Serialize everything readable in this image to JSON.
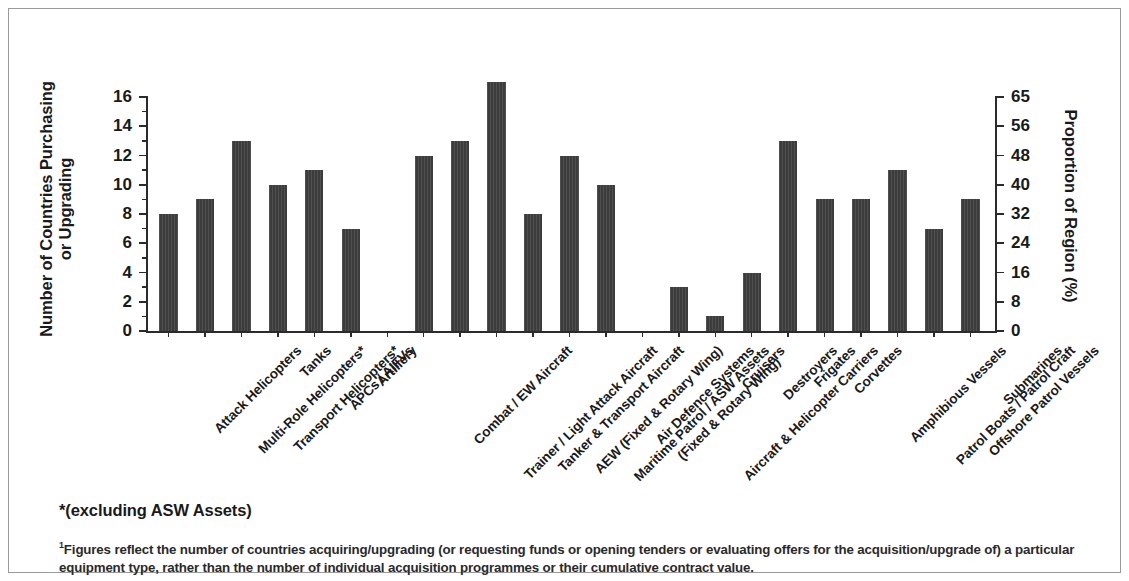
{
  "axes": {
    "left_title": "Number of Countries Purchasing or Upgrading",
    "right_title": "Proportion of Region (%)",
    "left_ticks": [
      "0",
      "2",
      "4",
      "6",
      "8",
      "10",
      "12",
      "14",
      "16"
    ],
    "right_ticks": [
      "0",
      "8",
      "16",
      "24",
      "32",
      "40",
      "48",
      "56",
      "65"
    ]
  },
  "notes": {
    "asterisk": "*(excluding ASW Assets)",
    "footnote_marker": "1",
    "footnote": "Figures reflect the number of countries acquiring/upgrading (or requesting funds or opening tenders or evaluating offers for the acquisition/upgrade of) a particular equipment type, rather than the number of individual acquisition programmes or their cumulative contract value."
  },
  "colors": {
    "bar": "#3c3c3c",
    "axis": "#2b2b2b",
    "border": "#9a9a9a",
    "background": "#ffffff"
  },
  "chart_data": {
    "type": "bar",
    "title": "",
    "xlabel": "",
    "ylabel": "Number of Countries Purchasing or Upgrading",
    "y2label": "Proportion of Region (%)",
    "ylim": [
      0,
      16
    ],
    "y2lim": [
      0,
      65
    ],
    "yticks": [
      0,
      2,
      4,
      6,
      8,
      10,
      12,
      14,
      16
    ],
    "y2ticks": [
      0,
      8,
      16,
      24,
      32,
      40,
      48,
      56,
      65
    ],
    "grid": false,
    "legend": "none",
    "groups": [
      {
        "name": "land-and-rotary",
        "categories": [
          "Attack Helicopters",
          "Multi-Role Helicopters*",
          "Transport Helicopters*",
          "Tanks",
          "APCs / AIFVs",
          "Artillery"
        ],
        "values": [
          8,
          9,
          13,
          10,
          11,
          7
        ]
      },
      {
        "name": "air",
        "categories": [
          "Combat / EW Aircraft",
          "Trainer / Light Attack Aircraft",
          "Tanker & Transport Aircraft",
          "AEW (Fixed & Rotary Wing)",
          "Maritime Patrol / ASW Assets (Fixed & Rotary Wing)",
          "Air Defence Systems"
        ],
        "values": [
          12,
          13,
          17,
          8,
          12,
          10
        ]
      },
      {
        "name": "naval",
        "categories": [
          "Aircraft & Helicopter Carriers",
          "Cruisers",
          "Destroyers",
          "Frigates",
          "Corvettes",
          "Amphibious Vessels",
          "Patrol Boats / Patrol Craft",
          "Offshore Patrol Vessels",
          "Submarines"
        ],
        "values": [
          3,
          1,
          4,
          13,
          9,
          9,
          11,
          7,
          9
        ]
      }
    ],
    "categories": [
      "Attack Helicopters",
      "Multi-Role Helicopters*",
      "Transport Helicopters*",
      "Tanks",
      "APCs / AIFVs",
      "Artillery",
      "Combat / EW Aircraft",
      "Trainer / Light Attack Aircraft",
      "Tanker & Transport Aircraft",
      "AEW (Fixed & Rotary Wing)",
      "Maritime Patrol / ASW Assets (Fixed & Rotary Wing)",
      "Air Defence Systems",
      "Aircraft & Helicopter Carriers",
      "Cruisers",
      "Destroyers",
      "Frigates",
      "Corvettes",
      "Amphibious Vessels",
      "Patrol Boats / Patrol Craft",
      "Offshore Patrol Vessels",
      "Submarines"
    ],
    "values": [
      8,
      9,
      13,
      10,
      11,
      7,
      12,
      13,
      17,
      8,
      12,
      10,
      3,
      1,
      4,
      13,
      9,
      9,
      11,
      7,
      9
    ],
    "category_labels_wrapped": [
      [
        "Attack Helicopters"
      ],
      [
        "Multi-Role Helicopters*"
      ],
      [
        "Transport Helicopters*"
      ],
      [
        "Tanks"
      ],
      [
        "APCs / AIFVs"
      ],
      [
        "Artillery"
      ],
      [
        "Combat / EW Aircraft"
      ],
      [
        "Trainer / Light Attack Aircraft"
      ],
      [
        "Tanker & Transport Aircraft"
      ],
      [
        "AEW (Fixed & Rotary Wing)"
      ],
      [
        "Maritime Patrol / ASW Assets",
        "(Fixed & Rotary Wing)"
      ],
      [
        "Air Defence Systems"
      ],
      [
        "Aircraft & Helicopter Carriers"
      ],
      [
        "Cruisers"
      ],
      [
        "Destroyers"
      ],
      [
        "Frigates"
      ],
      [
        "Corvettes"
      ],
      [
        "Amphibious Vessels"
      ],
      [
        "Patrol Boats / Patrol Craft"
      ],
      [
        "Offshore Patrol Vessels"
      ],
      [
        "Submarines"
      ]
    ]
  }
}
